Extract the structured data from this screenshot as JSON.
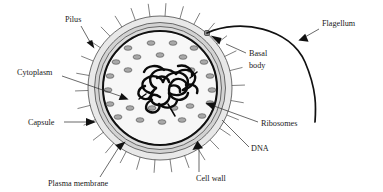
{
  "figure": {
    "background_color": "#ffffff"
  },
  "cell": {
    "center": {
      "x": 160,
      "y": 88
    },
    "structures": [
      {
        "name": "capsule",
        "label": "Capsule",
        "radius": 72,
        "fill": "#e8e8e8",
        "stroke": "#4a4a4a",
        "stroke_width": 0.8
      },
      {
        "name": "cell-wall",
        "label": "Cell wall",
        "radius": 65.5,
        "fill": "#d2d2d2",
        "stroke": "#4a4a4a",
        "stroke_width": 0.8
      },
      {
        "name": "cell-wall-inner",
        "label": "Cell wall",
        "radius": 61.5,
        "fill": "#dcdcdc",
        "stroke": "#4a4a4a",
        "stroke_width": 0.8
      },
      {
        "name": "plasma-membrane",
        "label": "Plasma membrane",
        "radius": 57,
        "fill": "#ffffff",
        "stroke": "#111111",
        "stroke_width": 2.1
      },
      {
        "name": "cytoplasm",
        "label": "Cytoplasm",
        "radius": 55.5,
        "fill": "#f7f7f7",
        "stroke": "none",
        "stroke_width": 0
      }
    ],
    "ribosome": {
      "label": "Ribosomes",
      "fill": "#a8a8a8",
      "stroke": "#4f4f4f",
      "rx": 4.0,
      "ry": 2.3,
      "positions": [
        {
          "x": 128,
          "y": 48
        },
        {
          "x": 151,
          "y": 43
        },
        {
          "x": 173,
          "y": 43
        },
        {
          "x": 194,
          "y": 48
        },
        {
          "x": 116,
          "y": 62
        },
        {
          "x": 137,
          "y": 57
        },
        {
          "x": 160,
          "y": 55
        },
        {
          "x": 183,
          "y": 57
        },
        {
          "x": 204,
          "y": 62
        },
        {
          "x": 110,
          "y": 76
        },
        {
          "x": 128,
          "y": 70
        },
        {
          "x": 191,
          "y": 70
        },
        {
          "x": 210,
          "y": 76
        },
        {
          "x": 108,
          "y": 90
        },
        {
          "x": 212,
          "y": 90
        },
        {
          "x": 110,
          "y": 104
        },
        {
          "x": 130,
          "y": 108
        },
        {
          "x": 190,
          "y": 106
        },
        {
          "x": 210,
          "y": 103
        },
        {
          "x": 118,
          "y": 117
        },
        {
          "x": 140,
          "y": 120
        },
        {
          "x": 162,
          "y": 122
        },
        {
          "x": 182,
          "y": 120
        },
        {
          "x": 202,
          "y": 116
        },
        {
          "x": 152,
          "y": 108
        },
        {
          "x": 174,
          "y": 108
        }
      ]
    },
    "dna": {
      "label": "DNA",
      "color": "#0a0a0a",
      "description": "tangled circular chromosome in nucleoid region"
    },
    "basal_body": {
      "label": "Basal body",
      "x": 207,
      "y": 33,
      "size": 5,
      "fill": "#8a8a8a",
      "stroke": "#2a2a2a"
    },
    "pili": {
      "label": "Pilus",
      "count": 30,
      "length": 13,
      "color": "#3a3a3a"
    },
    "flagellum": {
      "label": "Flagellum",
      "color": "#111111"
    }
  },
  "labels": [
    {
      "id": "pilus",
      "text": "Pilus",
      "x": 65,
      "y": 22,
      "anchor": "start"
    },
    {
      "id": "cytoplasm",
      "text": "Cytoplasm",
      "x": 17,
      "y": 75,
      "anchor": "start"
    },
    {
      "id": "capsule",
      "text": "Capsule",
      "x": 28,
      "y": 125,
      "anchor": "start"
    },
    {
      "id": "plasma-membrane",
      "text": "Plasma membrane",
      "x": 48,
      "y": 186,
      "anchor": "start"
    },
    {
      "id": "cell-wall",
      "text": "Cell wall",
      "x": 196,
      "y": 181,
      "anchor": "start"
    },
    {
      "id": "dna",
      "text": "DNA",
      "x": 251,
      "y": 151,
      "anchor": "start"
    },
    {
      "id": "ribosomes",
      "text": "Ribosomes",
      "x": 261,
      "y": 126,
      "anchor": "start"
    },
    {
      "id": "basal-body-1",
      "text": "Basal",
      "x": 249,
      "y": 56,
      "anchor": "start"
    },
    {
      "id": "basal-body-2",
      "text": "body",
      "x": 249,
      "y": 68,
      "anchor": "start"
    },
    {
      "id": "flagellum",
      "text": "Flagellum",
      "x": 322,
      "y": 26,
      "anchor": "start"
    }
  ]
}
